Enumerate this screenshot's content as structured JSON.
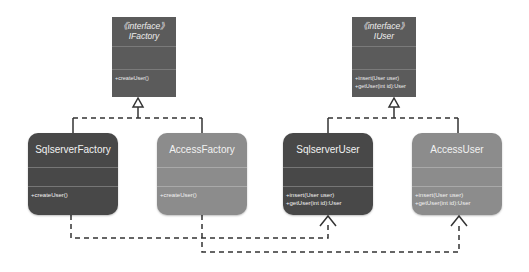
{
  "diagram": {
    "type": "uml-class-diagram",
    "colors": {
      "interface_fill": "#5b5b5b",
      "dark_class_fill": "#484848",
      "light_class_fill": "#8c8c8c",
      "line": "#333333"
    },
    "interfaces": [
      {
        "stereotype": "《interface》",
        "name": "IFactory",
        "operations": [
          "+createUser()"
        ]
      },
      {
        "stereotype": "《interface》",
        "name": "IUser",
        "operations": [
          "+insert(User user)",
          "+getUser(int id):User"
        ]
      }
    ],
    "classes": [
      {
        "name": "SqlserverFactory",
        "operations": [
          "+createUser()"
        ]
      },
      {
        "name": "AccessFactory",
        "operations": [
          "+createUser()"
        ]
      },
      {
        "name": "SqlserverUser",
        "operations": [
          "+insert(User user)",
          "+getUser(int id):User"
        ]
      },
      {
        "name": "AccessUser",
        "operations": [
          "+insert(User user)",
          "+getUser(int id):User"
        ]
      }
    ],
    "relations": [
      {
        "from": "SqlserverFactory",
        "to": "IFactory",
        "kind": "realization"
      },
      {
        "from": "AccessFactory",
        "to": "IFactory",
        "kind": "realization"
      },
      {
        "from": "SqlserverUser",
        "to": "IUser",
        "kind": "realization"
      },
      {
        "from": "AccessUser",
        "to": "IUser",
        "kind": "realization"
      },
      {
        "from": "SqlserverFactory",
        "to": "SqlserverUser",
        "kind": "dependency"
      },
      {
        "from": "AccessFactory",
        "to": "AccessUser",
        "kind": "dependency"
      }
    ]
  }
}
